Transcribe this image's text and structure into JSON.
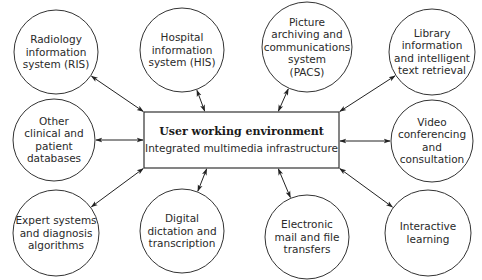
{
  "hub": {
    "title": "User working environment",
    "subtitle": "Integrated multimedia infrastructure"
  },
  "nodes": [
    {
      "id": "ris",
      "lines": [
        "Radiology",
        "information",
        "system (RIS)"
      ]
    },
    {
      "id": "his",
      "lines": [
        "Hospital",
        "information",
        "system (HIS)"
      ]
    },
    {
      "id": "pacs",
      "lines": [
        "Picture",
        "archiving and",
        "communications",
        "system",
        "(PACS)"
      ]
    },
    {
      "id": "library",
      "lines": [
        "Library",
        "information",
        "and intelligent",
        "text retrieval"
      ]
    },
    {
      "id": "other-db",
      "lines": [
        "Other",
        "clinical and",
        "patient",
        "databases"
      ]
    },
    {
      "id": "video",
      "lines": [
        "Video",
        "conferencing",
        "and",
        "consultation"
      ]
    },
    {
      "id": "expert",
      "lines": [
        "Expert systems",
        "and diagnosis",
        "algorithms"
      ]
    },
    {
      "id": "dictation",
      "lines": [
        "Digital",
        "dictation and",
        "transcription"
      ]
    },
    {
      "id": "email",
      "lines": [
        "Electronic",
        "mail and file",
        "transfers"
      ]
    },
    {
      "id": "learning",
      "lines": [
        "Interactive",
        "learning"
      ]
    }
  ],
  "connections": [
    {
      "from": "hub",
      "to": "ris",
      "bidirectional": true
    },
    {
      "from": "hub",
      "to": "his",
      "bidirectional": true
    },
    {
      "from": "hub",
      "to": "pacs",
      "bidirectional": true
    },
    {
      "from": "hub",
      "to": "library",
      "bidirectional": true
    },
    {
      "from": "hub",
      "to": "other-db",
      "bidirectional": true
    },
    {
      "from": "hub",
      "to": "video",
      "bidirectional": true
    },
    {
      "from": "hub",
      "to": "expert",
      "bidirectional": true
    },
    {
      "from": "hub",
      "to": "dictation",
      "bidirectional": true
    },
    {
      "from": "hub",
      "to": "email",
      "bidirectional": true
    },
    {
      "from": "hub",
      "to": "learning",
      "bidirectional": true
    }
  ]
}
